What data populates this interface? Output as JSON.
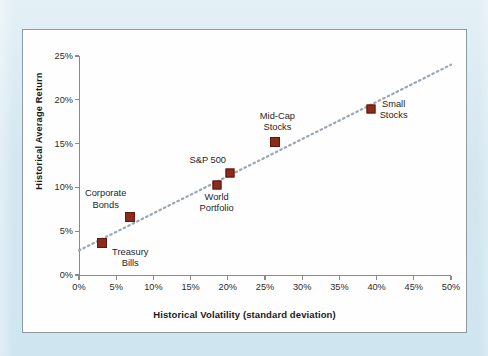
{
  "figure": {
    "panel_background": "#fefefe",
    "page_background": "#d9eaf2",
    "marker_color": "#8c2a1c",
    "axis_color": "#8a8a8a",
    "trendline_color": "#9aa6b0"
  },
  "chart_data": {
    "type": "scatter",
    "title": "",
    "xlabel": "Historical Volatility (standard deviation)",
    "ylabel": "Historical Average Return",
    "xlim": [
      0,
      50
    ],
    "ylim": [
      0,
      25
    ],
    "xticks": [
      "0%",
      "5%",
      "10%",
      "15%",
      "20%",
      "25%",
      "30%",
      "35%",
      "40%",
      "45%",
      "50%"
    ],
    "yticks": [
      "0%",
      "5%",
      "10%",
      "15%",
      "20%",
      "25%"
    ],
    "xtick_values": [
      0,
      5,
      10,
      15,
      20,
      25,
      30,
      35,
      40,
      45,
      50
    ],
    "ytick_values": [
      0,
      5,
      10,
      15,
      20,
      25
    ],
    "grid": false,
    "legend": "none",
    "points": [
      {
        "label": "Treasury Bills",
        "label_lines": [
          "Treasury",
          "Bills"
        ],
        "x": 3.1,
        "y": 3.7,
        "marker_size": 8,
        "label_position": "below-right"
      },
      {
        "label": "Corporate Bonds",
        "label_lines": [
          "Corporate",
          "Bonds"
        ],
        "x": 6.9,
        "y": 6.6,
        "marker_size": 8,
        "label_position": "above-left"
      },
      {
        "label": "World Portfolio",
        "label_lines": [
          "World",
          "Portfolio"
        ],
        "x": 18.5,
        "y": 10.3,
        "marker_size": 7,
        "label_position": "below"
      },
      {
        "label": "S&P 500",
        "label_lines": [
          "S&P 500"
        ],
        "x": 20.3,
        "y": 11.7,
        "marker_size": 7,
        "label_position": "above-left"
      },
      {
        "label": "Mid-Cap Stocks",
        "label_lines": [
          "Mid-Cap",
          "Stocks"
        ],
        "x": 26.4,
        "y": 15.2,
        "marker_size": 8,
        "label_position": "above"
      },
      {
        "label": "Small Stocks",
        "label_lines": [
          "Small",
          "Stocks"
        ],
        "x": 39.2,
        "y": 18.9,
        "marker_size": 7,
        "label_position": "right"
      }
    ],
    "trendline": {
      "style": "dotted",
      "x_start": 0,
      "y_start": 2.8,
      "x_end": 50,
      "y_end": 24.0
    },
    "annotations": []
  }
}
